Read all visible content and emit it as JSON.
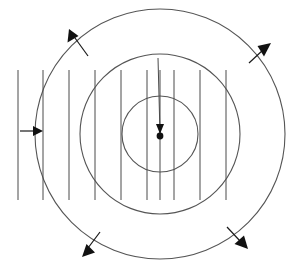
{
  "figure": {
    "caption": "",
    "background_color": "#ffffff",
    "line_color": "#4a4a4a",
    "circle_color": "#555555",
    "arrow_color": "#111111",
    "width": 289,
    "height": 272,
    "center": {
      "x": 160,
      "y": 134
    },
    "circles": [
      {
        "name": "outer-circle",
        "cx": 160,
        "cy": 134,
        "r": 125
      },
      {
        "name": "middle-circle",
        "cx": 160,
        "cy": 134,
        "r": 80
      },
      {
        "name": "inner-circle",
        "cx": 160,
        "cy": 134,
        "r": 38
      }
    ],
    "vertical_lines": [
      {
        "name": "vertical-line-1",
        "x": 18,
        "y1": 70,
        "y2": 200
      },
      {
        "name": "vertical-line-2",
        "x": 43,
        "y1": 70,
        "y2": 200
      },
      {
        "name": "vertical-line-3",
        "x": 69,
        "y1": 70,
        "y2": 200
      },
      {
        "name": "vertical-line-4",
        "x": 95,
        "y1": 70,
        "y2": 200
      },
      {
        "name": "vertical-line-5",
        "x": 121,
        "y1": 70,
        "y2": 200
      },
      {
        "name": "vertical-line-6",
        "x": 147,
        "y1": 70,
        "y2": 200
      },
      {
        "name": "vertical-line-7",
        "x": 160,
        "y1": 70,
        "y2": 200
      },
      {
        "name": "vertical-line-8",
        "x": 174,
        "y1": 70,
        "y2": 200
      },
      {
        "name": "vertical-line-9",
        "x": 200,
        "y1": 70,
        "y2": 200
      },
      {
        "name": "vertical-line-10",
        "x": 226,
        "y1": 70,
        "y2": 200
      }
    ],
    "radius_line": {
      "name": "radius-line",
      "x1": 158,
      "y1": 58,
      "x2": 160,
      "y2": 134
    },
    "arrows": [
      {
        "name": "incoming-wave-arrow",
        "direction": "right",
        "x1": 22,
        "y1": 131,
        "x2": 40,
        "y2": 131
      },
      {
        "name": "outward-arrow-top-left",
        "direction": "up-left",
        "x1": 88,
        "y1": 55,
        "x2": 70,
        "y2": 33
      },
      {
        "name": "outward-arrow-top-right",
        "direction": "up-right",
        "x1": 248,
        "y1": 63,
        "x2": 268,
        "y2": 46
      },
      {
        "name": "outward-arrow-bottom-left",
        "direction": "down-left",
        "x1": 100,
        "y1": 233,
        "x2": 84,
        "y2": 254
      },
      {
        "name": "outward-arrow-bottom-right",
        "direction": "down-right",
        "x1": 228,
        "y1": 228,
        "x2": 246,
        "y2": 246
      },
      {
        "name": "radius-arrow-to-center",
        "direction": "down",
        "x1": 159,
        "y1": 110,
        "x2": 160,
        "y2": 132
      }
    ],
    "center_dot": {
      "name": "center-point-source",
      "cx": 160,
      "cy": 136,
      "r": 3.4
    }
  }
}
